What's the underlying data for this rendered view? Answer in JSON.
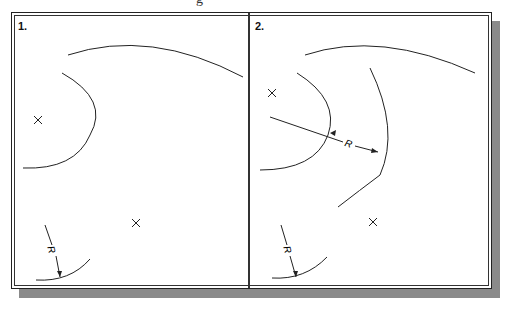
{
  "title_fragment": "g",
  "panels": [
    {
      "label": "1.",
      "dimension_label": "R"
    },
    {
      "label": "2.",
      "dimension_label_1": "R",
      "dimension_label_2": "R"
    }
  ],
  "colors": {
    "line": "#222222",
    "shadow": "#8a8a8a",
    "background": "#ffffff"
  }
}
